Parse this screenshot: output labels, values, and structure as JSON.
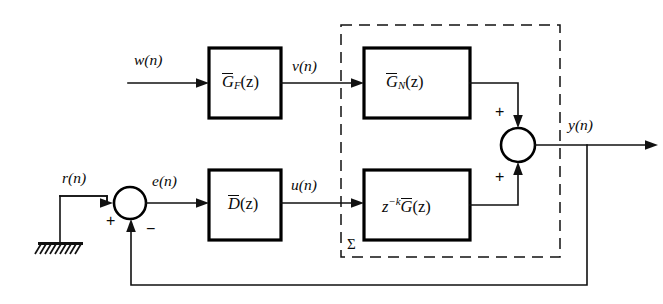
{
  "figure": {
    "type": "control-system-block-diagram",
    "background_color": "#ffffff",
    "line_color": "#111111",
    "width": 663,
    "height": 304
  },
  "signals": {
    "w": "w(n)",
    "v": "v(n)",
    "r": "r(n)",
    "e": "e(n)",
    "u": "u(n)",
    "y": "y(n)"
  },
  "blocks": {
    "filter": {
      "name": "G_F",
      "base": "G",
      "subscript": "F",
      "arg": "(z)"
    },
    "nominal": {
      "name": "G_N",
      "base": "G",
      "subscript": "N",
      "arg": "(z)"
    },
    "controller": {
      "name": "D",
      "base": "D",
      "arg": "(z)"
    },
    "plant": {
      "prefix": "z",
      "exponent": "−k",
      "base": "G",
      "arg": "(z)"
    }
  },
  "summers": {
    "left": {
      "plus": "+",
      "minus": "−"
    },
    "right": {
      "plus_top": "+",
      "plus_bottom": "+"
    }
  },
  "annotations": {
    "subsystem_label": "Σ"
  }
}
